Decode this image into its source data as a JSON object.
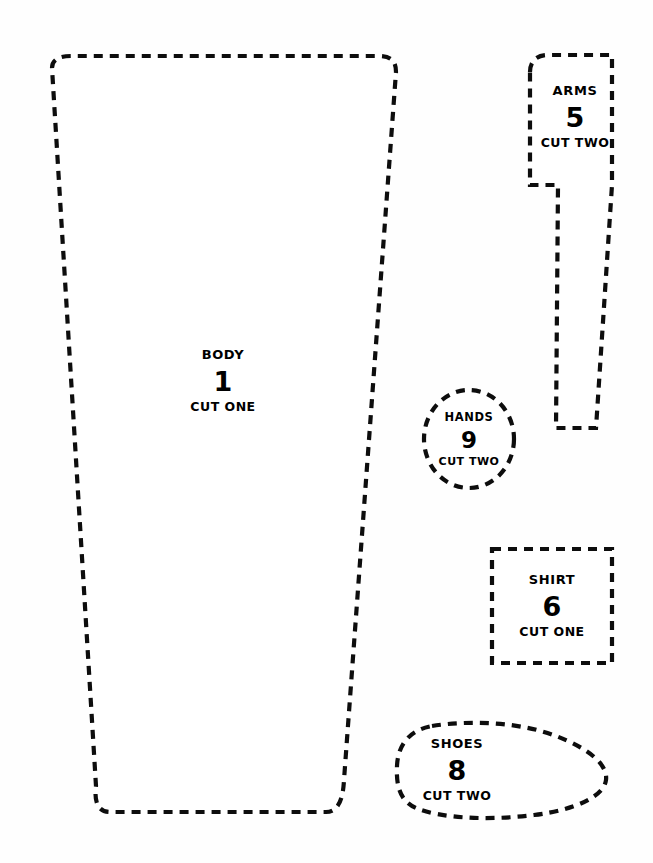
{
  "sheet": {
    "background_color": "#fefefe",
    "outline_color": "#0d0d0d",
    "text_color": "#000000",
    "width": 653,
    "height": 863
  },
  "pieces": [
    {
      "key": "body",
      "name": "BODY",
      "number": "1",
      "cut": "CUT ONE",
      "shape": "trapezoid",
      "label_x": 223,
      "label_y": 381,
      "path": "M 52 68 C 52 58 62 56 72 56 L 378 56 C 390 56 396 60 396 72 L 344 780 C 343 800 338 812 326 812 L 110 812 C 98 812 94 802 96 786 Z"
    },
    {
      "key": "arms",
      "name": "ARMS",
      "number": "5",
      "cut": "CUT TWO",
      "shape": "tapered-arm-with-notch",
      "label_x": 575,
      "label_y": 117,
      "path": "M 530 72 C 530 60 538 55 548 55 L 612 55 L 612 185 L 596 428 L 556 428 L 558 185 L 530 185 Z"
    },
    {
      "key": "hands",
      "name": "HANDS",
      "number": "9",
      "cut": "CUT TWO",
      "shape": "oval",
      "label_x": 469,
      "label_y": 439,
      "ellipse": {
        "cx": 469,
        "cy": 439,
        "rx": 45,
        "ry": 49
      }
    },
    {
      "key": "shirt",
      "name": "SHIRT",
      "number": "6",
      "cut": "CUT ONE",
      "shape": "rectangle",
      "label_x": 552,
      "label_y": 606,
      "rect": {
        "x": 492,
        "y": 549,
        "w": 120,
        "h": 114
      }
    },
    {
      "key": "shoes",
      "name": "SHOES",
      "number": "8",
      "cut": "CUT TWO",
      "shape": "shoe-sole-oval",
      "label_x": 457,
      "label_y": 770,
      "path": "M 432 726 C 470 720 520 722 556 736 C 590 749 608 765 606 780 C 604 796 576 810 534 815 C 486 821 440 818 416 808 C 400 801 396 786 397 766 C 398 744 410 730 432 726 Z"
    }
  ]
}
